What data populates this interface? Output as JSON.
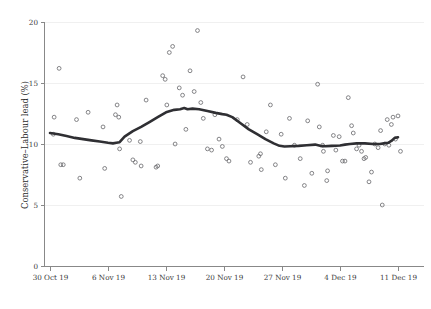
{
  "chart_data": {
    "type": "scatter",
    "title": "",
    "subtitle": "",
    "xlabel": "",
    "ylabel": "Conservative–Labour lead (%)",
    "ylim": [
      0,
      20
    ],
    "yticks": [
      0,
      5,
      10,
      15,
      20
    ],
    "ytick_labels": [
      "0",
      "5",
      "10",
      "15",
      "20"
    ],
    "xtick_labels": [
      "30 Oct 19",
      "6 Nov 19",
      "13 Nov 19",
      "20 Nov 19",
      "27 Nov 19",
      "4 Dec 19",
      "11 Dec 19"
    ],
    "xtick_days": [
      0,
      7,
      14,
      21,
      28,
      35,
      42
    ],
    "xlim_days": [
      -0.9,
      43.5
    ],
    "grid": "horizontal",
    "legend": "none",
    "series": [
      {
        "name": "Individual polls",
        "marker": "open-circle",
        "color": "#6f6f72",
        "points": [
          {
            "day": 0.4,
            "value": 10.8
          },
          {
            "day": 0.5,
            "value": 12.2
          },
          {
            "day": 1.1,
            "value": 16.2
          },
          {
            "day": 1.3,
            "value": 8.3
          },
          {
            "day": 1.6,
            "value": 8.3
          },
          {
            "day": 3.2,
            "value": 12.0
          },
          {
            "day": 3.6,
            "value": 7.2
          },
          {
            "day": 4.6,
            "value": 12.6
          },
          {
            "day": 6.4,
            "value": 11.4
          },
          {
            "day": 6.6,
            "value": 8.0
          },
          {
            "day": 7.9,
            "value": 12.4
          },
          {
            "day": 8.1,
            "value": 13.2
          },
          {
            "day": 8.3,
            "value": 12.2
          },
          {
            "day": 8.4,
            "value": 9.6
          },
          {
            "day": 8.6,
            "value": 5.7
          },
          {
            "day": 9.6,
            "value": 10.3
          },
          {
            "day": 10.0,
            "value": 8.7
          },
          {
            "day": 10.3,
            "value": 8.5
          },
          {
            "day": 10.9,
            "value": 10.2
          },
          {
            "day": 11.0,
            "value": 8.2
          },
          {
            "day": 11.6,
            "value": 13.6
          },
          {
            "day": 12.8,
            "value": 8.1
          },
          {
            "day": 13.0,
            "value": 8.2
          },
          {
            "day": 13.6,
            "value": 15.6
          },
          {
            "day": 13.9,
            "value": 15.3
          },
          {
            "day": 14.1,
            "value": 13.2
          },
          {
            "day": 14.4,
            "value": 17.5
          },
          {
            "day": 14.8,
            "value": 18.0
          },
          {
            "day": 15.1,
            "value": 10.0
          },
          {
            "day": 15.6,
            "value": 14.6
          },
          {
            "day": 16.0,
            "value": 14.0
          },
          {
            "day": 16.4,
            "value": 11.2
          },
          {
            "day": 16.9,
            "value": 16.0
          },
          {
            "day": 17.4,
            "value": 14.3
          },
          {
            "day": 17.8,
            "value": 19.3
          },
          {
            "day": 18.2,
            "value": 13.4
          },
          {
            "day": 18.5,
            "value": 12.1
          },
          {
            "day": 19.0,
            "value": 9.6
          },
          {
            "day": 19.5,
            "value": 9.5
          },
          {
            "day": 19.9,
            "value": 12.4
          },
          {
            "day": 20.4,
            "value": 10.4
          },
          {
            "day": 20.8,
            "value": 9.8
          },
          {
            "day": 21.3,
            "value": 8.8
          },
          {
            "day": 21.6,
            "value": 8.6
          },
          {
            "day": 22.6,
            "value": 12.0
          },
          {
            "day": 23.3,
            "value": 15.5
          },
          {
            "day": 23.8,
            "value": 11.6
          },
          {
            "day": 24.2,
            "value": 8.5
          },
          {
            "day": 25.2,
            "value": 9.0
          },
          {
            "day": 25.4,
            "value": 9.2
          },
          {
            "day": 25.5,
            "value": 7.9
          },
          {
            "day": 26.1,
            "value": 11.0
          },
          {
            "day": 26.6,
            "value": 13.2
          },
          {
            "day": 27.2,
            "value": 8.3
          },
          {
            "day": 27.9,
            "value": 10.8
          },
          {
            "day": 28.4,
            "value": 7.2
          },
          {
            "day": 28.9,
            "value": 12.1
          },
          {
            "day": 29.5,
            "value": 9.9
          },
          {
            "day": 30.2,
            "value": 8.8
          },
          {
            "day": 30.7,
            "value": 6.6
          },
          {
            "day": 31.1,
            "value": 11.9
          },
          {
            "day": 31.6,
            "value": 7.6
          },
          {
            "day": 32.3,
            "value": 14.9
          },
          {
            "day": 32.5,
            "value": 11.4
          },
          {
            "day": 32.9,
            "value": 9.9
          },
          {
            "day": 33.0,
            "value": 9.4
          },
          {
            "day": 33.4,
            "value": 7.0
          },
          {
            "day": 33.5,
            "value": 7.8
          },
          {
            "day": 34.2,
            "value": 10.7
          },
          {
            "day": 34.5,
            "value": 9.5
          },
          {
            "day": 34.9,
            "value": 10.6
          },
          {
            "day": 35.3,
            "value": 8.6
          },
          {
            "day": 35.6,
            "value": 8.6
          },
          {
            "day": 36.0,
            "value": 13.8
          },
          {
            "day": 36.4,
            "value": 11.5
          },
          {
            "day": 36.6,
            "value": 10.9
          },
          {
            "day": 37.0,
            "value": 9.6
          },
          {
            "day": 37.3,
            "value": 9.9
          },
          {
            "day": 37.6,
            "value": 9.4
          },
          {
            "day": 37.9,
            "value": 8.8
          },
          {
            "day": 38.1,
            "value": 8.9
          },
          {
            "day": 38.5,
            "value": 6.9
          },
          {
            "day": 38.8,
            "value": 7.7
          },
          {
            "day": 39.2,
            "value": 10.0
          },
          {
            "day": 39.6,
            "value": 9.7
          },
          {
            "day": 39.9,
            "value": 11.1
          },
          {
            "day": 40.1,
            "value": 5.0
          },
          {
            "day": 40.4,
            "value": 10.0
          },
          {
            "day": 40.7,
            "value": 12.0
          },
          {
            "day": 40.9,
            "value": 9.9
          },
          {
            "day": 41.2,
            "value": 11.6
          },
          {
            "day": 41.4,
            "value": 12.2
          },
          {
            "day": 41.7,
            "value": 10.4
          },
          {
            "day": 42.0,
            "value": 12.3
          },
          {
            "day": 42.3,
            "value": 9.4
          }
        ]
      },
      {
        "name": "Smoothed trend",
        "marker": "none",
        "color": "#2f2f33",
        "line": [
          {
            "day": 0.0,
            "value": 10.9
          },
          {
            "day": 1.0,
            "value": 10.8
          },
          {
            "day": 2.0,
            "value": 10.65
          },
          {
            "day": 3.0,
            "value": 10.5
          },
          {
            "day": 4.0,
            "value": 10.4
          },
          {
            "day": 5.0,
            "value": 10.3
          },
          {
            "day": 6.0,
            "value": 10.2
          },
          {
            "day": 7.0,
            "value": 10.1
          },
          {
            "day": 7.6,
            "value": 10.05
          },
          {
            "day": 8.0,
            "value": 10.1
          },
          {
            "day": 8.4,
            "value": 10.15
          },
          {
            "day": 9.0,
            "value": 10.6
          },
          {
            "day": 10.0,
            "value": 11.05
          },
          {
            "day": 11.0,
            "value": 11.4
          },
          {
            "day": 12.0,
            "value": 11.8
          },
          {
            "day": 13.0,
            "value": 12.2
          },
          {
            "day": 14.0,
            "value": 12.6
          },
          {
            "day": 15.0,
            "value": 12.8
          },
          {
            "day": 15.7,
            "value": 12.85
          },
          {
            "day": 16.2,
            "value": 12.95
          },
          {
            "day": 16.6,
            "value": 12.85
          },
          {
            "day": 17.2,
            "value": 12.9
          },
          {
            "day": 18.0,
            "value": 12.85
          },
          {
            "day": 19.0,
            "value": 12.7
          },
          {
            "day": 20.0,
            "value": 12.55
          },
          {
            "day": 20.8,
            "value": 12.45
          },
          {
            "day": 21.3,
            "value": 12.4
          },
          {
            "day": 22.0,
            "value": 12.2
          },
          {
            "day": 23.0,
            "value": 11.7
          },
          {
            "day": 24.0,
            "value": 11.2
          },
          {
            "day": 25.0,
            "value": 10.8
          },
          {
            "day": 26.0,
            "value": 10.4
          },
          {
            "day": 27.0,
            "value": 10.05
          },
          {
            "day": 27.7,
            "value": 9.85
          },
          {
            "day": 28.3,
            "value": 9.8
          },
          {
            "day": 29.0,
            "value": 9.82
          },
          {
            "day": 30.0,
            "value": 9.85
          },
          {
            "day": 31.0,
            "value": 9.9
          },
          {
            "day": 32.0,
            "value": 9.95
          },
          {
            "day": 32.6,
            "value": 9.85
          },
          {
            "day": 33.2,
            "value": 9.82
          },
          {
            "day": 34.0,
            "value": 9.85
          },
          {
            "day": 35.0,
            "value": 9.88
          },
          {
            "day": 35.6,
            "value": 9.95
          },
          {
            "day": 36.2,
            "value": 10.0
          },
          {
            "day": 37.0,
            "value": 10.05
          },
          {
            "day": 38.0,
            "value": 10.05
          },
          {
            "day": 39.0,
            "value": 10.0
          },
          {
            "day": 39.8,
            "value": 10.0
          },
          {
            "day": 40.3,
            "value": 10.05
          },
          {
            "day": 40.8,
            "value": 10.1
          },
          {
            "day": 41.2,
            "value": 10.25
          },
          {
            "day": 41.6,
            "value": 10.5
          },
          {
            "day": 42.0,
            "value": 10.55
          }
        ]
      }
    ]
  },
  "colors": {
    "marker": "#6f6f72",
    "trend": "#2f2f33",
    "axis": "#888888",
    "grid": "#f0f0f0",
    "background": "#ffffff",
    "text": "#2b2b2b"
  }
}
